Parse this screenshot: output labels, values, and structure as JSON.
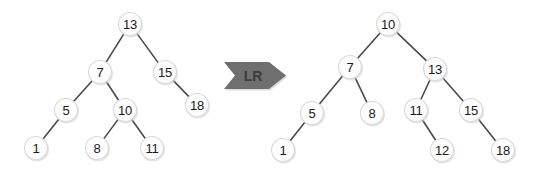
{
  "diagram": {
    "canvas": {
      "width": 542,
      "height": 178,
      "background": "#ffffff"
    },
    "style": {
      "node_fill": "#fdfdfd",
      "node_stroke": "#d9d9d9",
      "node_radius": 11.5,
      "edge_color": "#4a4a4a",
      "label_color": "#1a1a1a",
      "arrow_fill": "#6f6f6f",
      "arrow_text_color": "#3c3c3c"
    },
    "arrow": {
      "label": "LR",
      "name": "lr-rotation-arrow",
      "direction": "right",
      "x": 224,
      "y": 62,
      "width": 62,
      "height": 27
    },
    "trees": [
      {
        "name": "before-tree",
        "role": "before",
        "root": "13",
        "nodes": [
          {
            "id": "n13",
            "label": "13",
            "x": 130,
            "y": 24
          },
          {
            "id": "n7",
            "label": "7",
            "x": 100,
            "y": 72
          },
          {
            "id": "n15",
            "label": "15",
            "x": 165,
            "y": 72
          },
          {
            "id": "n5",
            "label": "5",
            "x": 66,
            "y": 110
          },
          {
            "id": "n10",
            "label": "10",
            "x": 125,
            "y": 110
          },
          {
            "id": "n18",
            "label": "18",
            "x": 197,
            "y": 105
          },
          {
            "id": "n1",
            "label": "1",
            "x": 36,
            "y": 148
          },
          {
            "id": "n8",
            "label": "8",
            "x": 97,
            "y": 148
          },
          {
            "id": "n11",
            "label": "11",
            "x": 152,
            "y": 148
          }
        ],
        "edges": [
          {
            "from": "n13",
            "to": "n7"
          },
          {
            "from": "n13",
            "to": "n15"
          },
          {
            "from": "n7",
            "to": "n5"
          },
          {
            "from": "n7",
            "to": "n10"
          },
          {
            "from": "n15",
            "to": "n18"
          },
          {
            "from": "n5",
            "to": "n1"
          },
          {
            "from": "n10",
            "to": "n8"
          },
          {
            "from": "n10",
            "to": "n11"
          }
        ]
      },
      {
        "name": "after-tree",
        "role": "after",
        "root": "10",
        "nodes": [
          {
            "id": "m10",
            "label": "10",
            "x": 388,
            "y": 24
          },
          {
            "id": "m7",
            "label": "7",
            "x": 350,
            "y": 67
          },
          {
            "id": "m13",
            "label": "13",
            "x": 435,
            "y": 69
          },
          {
            "id": "m5",
            "label": "5",
            "x": 312,
            "y": 113
          },
          {
            "id": "m8",
            "label": "8",
            "x": 372,
            "y": 113
          },
          {
            "id": "m11",
            "label": "11",
            "x": 416,
            "y": 110
          },
          {
            "id": "m15",
            "label": "15",
            "x": 471,
            "y": 110
          },
          {
            "id": "m1",
            "label": "1",
            "x": 283,
            "y": 150
          },
          {
            "id": "m12",
            "label": "12",
            "x": 442,
            "y": 150
          },
          {
            "id": "m18",
            "label": "18",
            "x": 503,
            "y": 150
          }
        ],
        "edges": [
          {
            "from": "m10",
            "to": "m7"
          },
          {
            "from": "m10",
            "to": "m13"
          },
          {
            "from": "m7",
            "to": "m5"
          },
          {
            "from": "m7",
            "to": "m8"
          },
          {
            "from": "m13",
            "to": "m11"
          },
          {
            "from": "m13",
            "to": "m15"
          },
          {
            "from": "m5",
            "to": "m1"
          },
          {
            "from": "m11",
            "to": "m12"
          },
          {
            "from": "m15",
            "to": "m18"
          }
        ]
      }
    ]
  }
}
